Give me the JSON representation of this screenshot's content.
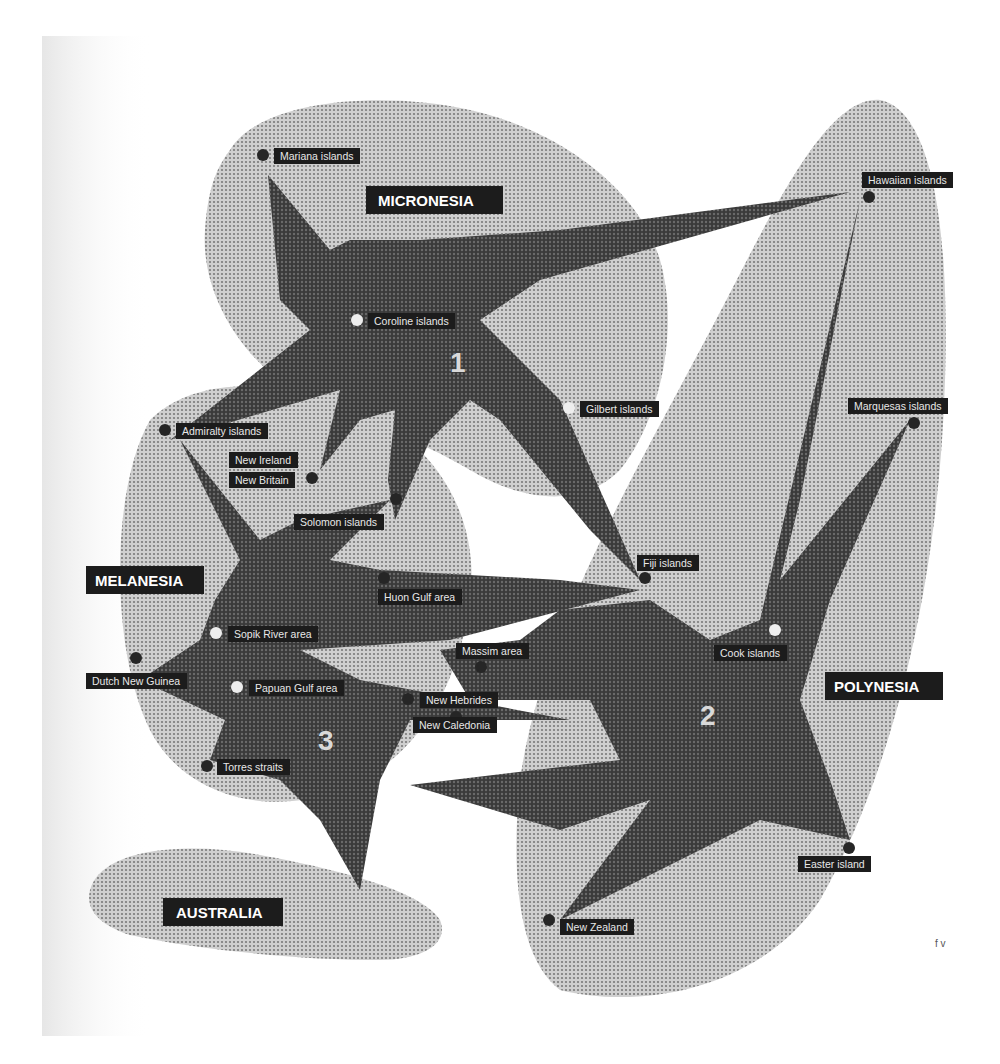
{
  "colors": {
    "region_fill": "#b9b9b9",
    "region_dot": "#8a8a8a",
    "cluster_fill": "#4a4a4a",
    "label_bg": "#1c1c1c",
    "label_text": "#e8e8e8",
    "node_dark": "#262626",
    "node_light": "#eeeeee",
    "paper_shade": "#ececec"
  },
  "regions": [
    {
      "id": "micronesia",
      "label": "MICRONESIA"
    },
    {
      "id": "melanesia",
      "label": "MELANESIA"
    },
    {
      "id": "polynesia",
      "label": "POLYNESIA"
    },
    {
      "id": "australia",
      "label": "AUSTRALIA"
    }
  ],
  "clusters": [
    {
      "id": "1",
      "label": "1",
      "hub": "Coroline islands"
    },
    {
      "id": "2",
      "label": "2",
      "hub": "Cook islands"
    },
    {
      "id": "3",
      "label": "3",
      "hub": "Papuan Gulf area"
    }
  ],
  "locations": [
    {
      "name": "Mariana islands",
      "type": "dark"
    },
    {
      "name": "Hawaiian islands",
      "type": "dark"
    },
    {
      "name": "Coroline islands",
      "type": "light"
    },
    {
      "name": "Gilbert islands",
      "type": "light"
    },
    {
      "name": "Marquesas islands",
      "type": "dark"
    },
    {
      "name": "Admiralty islands",
      "type": "dark"
    },
    {
      "name": "New Ireland",
      "type": "dark"
    },
    {
      "name": "New Britain",
      "type": "dark"
    },
    {
      "name": "Solomon islands",
      "type": "dark"
    },
    {
      "name": "Huon Gulf area",
      "type": "dark"
    },
    {
      "name": "Fiji islands",
      "type": "dark"
    },
    {
      "name": "Sopik River area",
      "type": "light"
    },
    {
      "name": "Massim area",
      "type": "dark"
    },
    {
      "name": "Cook islands",
      "type": "light"
    },
    {
      "name": "Dutch New Guinea",
      "type": "dark"
    },
    {
      "name": "Papuan Gulf area",
      "type": "light"
    },
    {
      "name": "New Hebrides",
      "type": "dark"
    },
    {
      "name": "New Caledonia",
      "type": "dark"
    },
    {
      "name": "Torres straits",
      "type": "dark"
    },
    {
      "name": "Easter island",
      "type": "dark"
    },
    {
      "name": "New Zealand",
      "type": "dark"
    }
  ],
  "credit": {
    "text": "f v"
  }
}
